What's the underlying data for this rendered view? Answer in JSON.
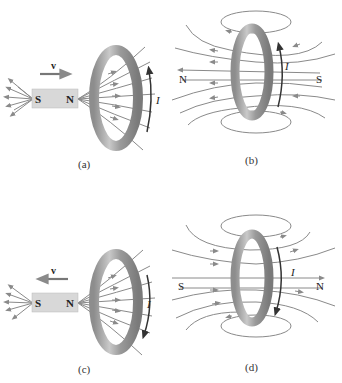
{
  "colors": {
    "field_line": "#8a8a8a",
    "ring_dark": "#6e6e6e",
    "ring_mid": "#a8a8a8",
    "ring_light": "#d4d4d4",
    "magnet_fill": "#d8d8d8",
    "current_arrow": "#333333",
    "text": "#222222"
  },
  "panels": [
    {
      "id": "a",
      "caption": "(a)",
      "magnet": {
        "left_pole": "S",
        "right_pole": "N"
      },
      "velocity_label": "v",
      "velocity_direction": "right",
      "current_label": "I",
      "current_direction": "up"
    },
    {
      "id": "b",
      "caption": "(b)",
      "left_pole": "N",
      "right_pole": "S",
      "current_label": "I",
      "current_direction": "up",
      "field_direction": "left"
    },
    {
      "id": "c",
      "caption": "(c)",
      "magnet": {
        "left_pole": "S",
        "right_pole": "N"
      },
      "velocity_label": "v",
      "velocity_direction": "left",
      "current_label": "I",
      "current_direction": "down"
    },
    {
      "id": "d",
      "caption": "(d)",
      "left_pole": "S",
      "right_pole": "N",
      "current_label": "I",
      "current_direction": "down",
      "field_direction": "right"
    }
  ]
}
